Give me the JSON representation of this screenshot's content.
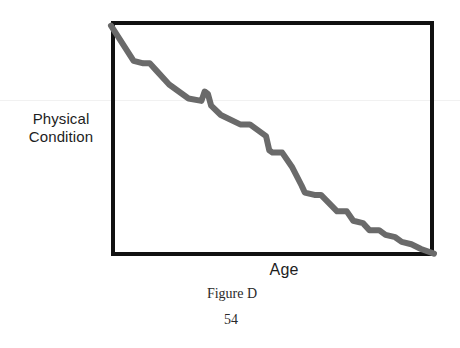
{
  "page": {
    "width": 460,
    "height": 348,
    "background_color": "#ffffff",
    "folio": "54"
  },
  "figure": {
    "caption": "Figure D"
  },
  "axes": {
    "y_label_line1": "Physical",
    "y_label_line2": "Condition",
    "x_label": "Age",
    "frame_color": "#111111"
  },
  "chart_data": {
    "type": "line",
    "title": "Figure D",
    "xlabel": "Age",
    "ylabel": "Physical Condition",
    "grid": false,
    "legend": null,
    "axis_tick_labels": {
      "x": [],
      "y": []
    },
    "xlim": [
      0,
      100
    ],
    "ylim": [
      0,
      100
    ],
    "series": [
      {
        "name": "Physical Condition vs Age",
        "line_color": "#6a6a6a",
        "line_width": 6,
        "description": "Steadily declining stepwise curve from upper-left to lower-right with small plateaus and one brief upward bump",
        "x": [
          0,
          7,
          10,
          12,
          14,
          18,
          24,
          28,
          29,
          30,
          31,
          34,
          40,
          43,
          48,
          49,
          50,
          53,
          56,
          59,
          60,
          63,
          65,
          70,
          73,
          75,
          78,
          80,
          83,
          85,
          88,
          90,
          93,
          96,
          100
        ],
        "y": [
          98,
          83,
          82,
          82,
          79,
          73,
          67,
          66,
          70,
          69,
          64,
          60,
          56,
          56,
          51,
          45,
          44,
          44,
          38,
          30,
          27,
          26,
          26,
          19,
          19,
          15,
          14,
          11,
          11,
          9,
          8,
          6,
          5,
          3,
          1
        ]
      }
    ]
  }
}
